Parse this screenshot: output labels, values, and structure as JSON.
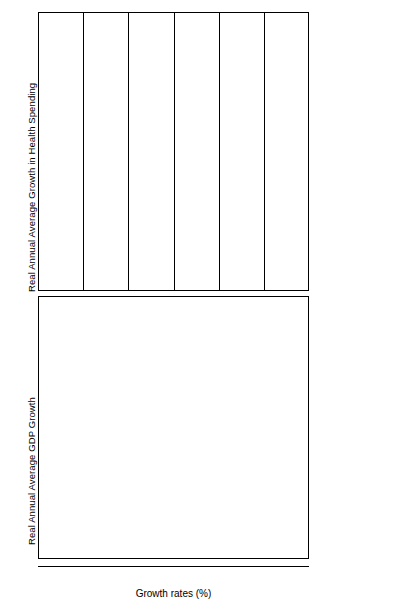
{
  "chart_data": {
    "type": "bar",
    "orientation": "horizontal",
    "title": "",
    "xlabel": "Growth rates (%)",
    "ylabel": "",
    "xlim": [
      -10,
      20
    ],
    "xticks": [
      -10,
      -5,
      0,
      5,
      10,
      15,
      20
    ],
    "xticklabels": [
      "–10",
      "–5",
      "0",
      "5",
      "10",
      "15",
      "20"
    ],
    "grid": true,
    "gridlines_at": [
      -5,
      0,
      5,
      10,
      15
    ],
    "legend_position": "right",
    "legend": [
      "1990-94",
      "1970-80",
      "1960-70"
    ],
    "series_colors": [
      "#000000",
      "#b0b0b0",
      "#ffffff"
    ],
    "panels": [
      {
        "id": "health",
        "ylabel": "Real Annual Average Growth in Health Spending",
        "categories": [
          "UK",
          "Sweden",
          "Spain",
          "Portugal",
          "Netherlands",
          "Luxembourg",
          "Italy",
          "Ireland",
          "Greece",
          "Germany",
          "France",
          "Finland",
          "Denmark",
          "Belguim",
          "Austria"
        ],
        "series": [
          {
            "name": "1990-94",
            "values": [
              3.6,
              -5.6,
              3.2,
              6.8,
              2.7,
              4.9,
              2.1,
              0.2,
              0.4,
              3.6,
              5.4,
              -2.6,
              2.0,
              2.1,
              4.3
            ]
          },
          {
            "name": "1970-80",
            "values": [
              4.6,
              2.0,
              6.8,
              8.6,
              0.3,
              7.2,
              6.2,
              10.6,
              5.0,
              5.6,
              7.5,
              5.2,
              5.0,
              7.9,
              5.5
            ]
          },
          {
            "name": "1960-70",
            "values": [
              5.6,
              9.8,
              16.7,
              10.9,
              8.2,
              6.5,
              7.5,
              9.3,
              12.0,
              6.6,
              9.8,
              11.2,
              9.6,
              5.3,
              3.3
            ]
          }
        ]
      },
      {
        "id": "gdp",
        "ylabel": "Real Annual Average GDP Growth",
        "categories": [
          "UK",
          "Sweden",
          "Spain",
          "Portugal",
          "Netherlands",
          "Luxembourg",
          "Italy",
          "Ireland",
          "Greece",
          "Germany",
          "France",
          "Finland",
          "Denmark",
          "Belgium",
          "Austria"
        ],
        "series": [
          {
            "name": "1990-94",
            "values": [
              0.8,
              -0.6,
              1.5,
              1.9,
              2.0,
              0.6,
              1.3,
              1.5,
              0.9,
              1.8,
              1.0,
              0.4,
              1.2,
              1.5,
              2.2
            ]
          },
          {
            "name": "1970-80",
            "values": [
              1.8,
              1.8,
              3.4,
              4.6,
              2.9,
              1.7,
              3.5,
              4.6,
              4.4,
              2.8,
              3.2,
              3.4,
              2.1,
              3.2,
              3.5
            ]
          },
          {
            "name": "1960-70",
            "values": [
              2.9,
              4.5,
              7.2,
              6.2,
              5.0,
              4.0,
              5.6,
              4.2,
              7.6,
              4.4,
              5.6,
              4.8,
              4.6,
              4.8,
              4.7
            ]
          }
        ]
      }
    ]
  },
  "axis": {
    "xlabel": "Growth rates (%)",
    "ticks": [
      "–10",
      "–5",
      "0",
      "5",
      "10",
      "15",
      "20"
    ]
  },
  "panel_titles": {
    "health": "Real Annual Average Growth in Health Spending",
    "gdp": "Real Annual Average GDP Growth"
  },
  "legend": {
    "items": [
      {
        "label": "1990-94",
        "color": "#000000"
      },
      {
        "label": "1970-80",
        "color": "#b0b0b0"
      },
      {
        "label": "1960-70",
        "color": "#ffffff"
      }
    ]
  }
}
